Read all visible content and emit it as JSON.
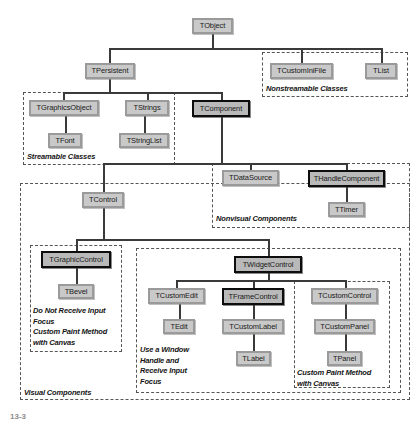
{
  "diagram": {
    "colors": {
      "node_fill": "#c9c9c9",
      "node_border": "#9a9a9a",
      "highlight_border": "#0d0d0d",
      "group_border": "#555555",
      "connector": "#3a3a3a",
      "background": "#ffffff"
    },
    "nodes": [
      {
        "id": "tobject",
        "label": "TObject",
        "x": 192,
        "y": 18,
        "w": 41,
        "h": 16,
        "style": "normal"
      },
      {
        "id": "tpersistent",
        "label": "TPersistent",
        "x": 85,
        "y": 63,
        "w": 50,
        "h": 16,
        "style": "normal"
      },
      {
        "id": "tcustominifile",
        "label": "TCustomIniFile",
        "x": 270,
        "y": 63,
        "w": 63,
        "h": 16,
        "style": "normal"
      },
      {
        "id": "tlist",
        "label": "TList",
        "x": 365,
        "y": 63,
        "w": 32,
        "h": 16,
        "style": "normal"
      },
      {
        "id": "tgraphicsobject",
        "label": "TGraphicsObject",
        "x": 29,
        "y": 100,
        "w": 70,
        "h": 16,
        "style": "normal"
      },
      {
        "id": "tstrings",
        "label": "TStrings",
        "x": 125,
        "y": 100,
        "w": 44,
        "h": 16,
        "style": "normal"
      },
      {
        "id": "tcomponent",
        "label": "TComponent",
        "x": 192,
        "y": 100,
        "w": 58,
        "h": 17,
        "style": "highlight"
      },
      {
        "id": "tfont",
        "label": "TFont",
        "x": 48,
        "y": 133,
        "w": 34,
        "h": 15,
        "style": "normal"
      },
      {
        "id": "tstringlist",
        "label": "TStringList",
        "x": 119,
        "y": 133,
        "w": 50,
        "h": 15,
        "style": "normal"
      },
      {
        "id": "tdatasource",
        "label": "TDataSource",
        "x": 222,
        "y": 170,
        "w": 57,
        "h": 16,
        "style": "normal"
      },
      {
        "id": "thandlecomponent",
        "label": "THandleComponent",
        "x": 308,
        "y": 170,
        "w": 77,
        "h": 17,
        "style": "highlight"
      },
      {
        "id": "ttimer",
        "label": "TTimer",
        "x": 328,
        "y": 202,
        "w": 37,
        "h": 15,
        "style": "normal"
      },
      {
        "id": "tcontrol",
        "label": "TControl",
        "x": 82,
        "y": 192,
        "w": 42,
        "h": 16,
        "style": "normal"
      },
      {
        "id": "tgraphiccontrol",
        "label": "TGraphicControl",
        "x": 41,
        "y": 251,
        "w": 70,
        "h": 17,
        "style": "highlight"
      },
      {
        "id": "tbevel",
        "label": "TBevel",
        "x": 58,
        "y": 284,
        "w": 36,
        "h": 15,
        "style": "normal"
      },
      {
        "id": "twidgetcontrol",
        "label": "TWidgetControl",
        "x": 234,
        "y": 256,
        "w": 68,
        "h": 17,
        "style": "highlight"
      },
      {
        "id": "tcustomedit",
        "label": "TCustomEdit",
        "x": 148,
        "y": 288,
        "w": 57,
        "h": 16,
        "style": "normal"
      },
      {
        "id": "tframecontrol",
        "label": "TFrameControl",
        "x": 222,
        "y": 288,
        "w": 62,
        "h": 17,
        "style": "highlight"
      },
      {
        "id": "tcustomcontrol",
        "label": "TCustomControl",
        "x": 311,
        "y": 288,
        "w": 67,
        "h": 16,
        "style": "normal"
      },
      {
        "id": "tedit",
        "label": "TEdit",
        "x": 163,
        "y": 319,
        "w": 32,
        "h": 15,
        "style": "normal"
      },
      {
        "id": "tcustomlabel",
        "label": "TCustomLabel",
        "x": 222,
        "y": 319,
        "w": 62,
        "h": 15,
        "style": "normal"
      },
      {
        "id": "tcustompanel",
        "label": "TCustomPanel",
        "x": 314,
        "y": 319,
        "w": 61,
        "h": 15,
        "style": "normal"
      },
      {
        "id": "tlabel",
        "label": "TLabel",
        "x": 236,
        "y": 351,
        "w": 35,
        "h": 15,
        "style": "normal"
      },
      {
        "id": "tpanel",
        "label": "TPanel",
        "x": 327,
        "y": 351,
        "w": 35,
        "h": 15,
        "style": "normal"
      }
    ],
    "groups": [
      {
        "id": "nonstreamable",
        "x": 262,
        "y": 52,
        "w": 146,
        "h": 45
      },
      {
        "id": "streamable",
        "x": 23,
        "y": 92,
        "w": 152,
        "h": 73
      },
      {
        "id": "nonvisual",
        "x": 212,
        "y": 163,
        "w": 198,
        "h": 65
      },
      {
        "id": "visual",
        "x": 20,
        "y": 183,
        "w": 390,
        "h": 217
      },
      {
        "id": "graphic",
        "x": 30,
        "y": 245,
        "w": 92,
        "h": 107
      },
      {
        "id": "widget",
        "x": 136,
        "y": 248,
        "w": 265,
        "h": 145
      },
      {
        "id": "customcontrol",
        "x": 294,
        "y": 281,
        "w": 96,
        "h": 107
      }
    ],
    "captions": [
      {
        "id": "cap-nonstreamable",
        "text": "Nonstreamable Classes",
        "x": 266,
        "y": 84
      },
      {
        "id": "cap-streamable",
        "text": "Streamable Classes",
        "x": 27,
        "y": 152
      },
      {
        "id": "cap-nonvisual",
        "text": "Nonvisual Components",
        "x": 216,
        "y": 214
      },
      {
        "id": "cap-graphic",
        "text": "Do Not Receive Input\nFocus\nCustom Paint Method\nwith Canvas",
        "x": 33,
        "y": 306
      },
      {
        "id": "cap-visual",
        "text": "Visual Components",
        "x": 24,
        "y": 388
      },
      {
        "id": "cap-widget",
        "text": "Use a Window\nHandle and\nReceive Input\nFocus",
        "x": 140,
        "y": 345
      },
      {
        "id": "cap-customcontrol",
        "text": "Custom Paint Method\nwith Canvas",
        "x": 297,
        "y": 368
      }
    ],
    "edges": [
      {
        "id": "e-tobject-stem",
        "type": "v",
        "x": 212,
        "y": 34,
        "len": 14
      },
      {
        "id": "e-tobject-bus",
        "type": "h",
        "x": 109,
        "y": 48,
        "len": 272
      },
      {
        "id": "e-tpersistent-drop",
        "type": "v",
        "x": 109,
        "y": 48,
        "len": 15
      },
      {
        "id": "e-tcustominifile-dr",
        "type": "v",
        "x": 301,
        "y": 48,
        "len": 15
      },
      {
        "id": "e-tlist-drop",
        "type": "v",
        "x": 381,
        "y": 48,
        "len": 15
      },
      {
        "id": "e-tpersistent-stem",
        "type": "v",
        "x": 109,
        "y": 79,
        "len": 13
      },
      {
        "id": "e-persist-bus",
        "type": "h",
        "x": 63,
        "y": 92,
        "len": 159
      },
      {
        "id": "e-tgraphicsobj-drop",
        "type": "v",
        "x": 63,
        "y": 92,
        "len": 8
      },
      {
        "id": "e-tstrings-drop",
        "type": "v",
        "x": 147,
        "y": 92,
        "len": 8
      },
      {
        "id": "e-tcomponent-drop",
        "type": "v",
        "x": 221,
        "y": 92,
        "len": 8
      },
      {
        "id": "e-tfont",
        "type": "v",
        "x": 65,
        "y": 116,
        "len": 17
      },
      {
        "id": "e-tstringlist",
        "type": "v",
        "x": 144,
        "y": 116,
        "len": 17
      },
      {
        "id": "e-tcomp-stem",
        "type": "v",
        "x": 221,
        "y": 117,
        "len": 46
      },
      {
        "id": "e-comp-bus",
        "type": "h",
        "x": 103,
        "y": 163,
        "len": 244
      },
      {
        "id": "e-tdatasource-drop",
        "type": "v",
        "x": 250,
        "y": 163,
        "len": 7
      },
      {
        "id": "e-thandle-drop",
        "type": "v",
        "x": 346,
        "y": 163,
        "len": 7
      },
      {
        "id": "e-comp-left-down",
        "type": "v",
        "x": 103,
        "y": 163,
        "len": 9
      },
      {
        "id": "e-comp-left-h",
        "type": "h",
        "x": 103,
        "y": 172,
        "len": 0
      },
      {
        "id": "e-tcontrol-drop",
        "type": "v",
        "x": 103,
        "y": 172,
        "len": 21
      },
      {
        "id": "e-ttimer",
        "type": "v",
        "x": 346,
        "y": 187,
        "len": 15
      },
      {
        "id": "e-tcontrol-stem",
        "type": "v",
        "x": 103,
        "y": 208,
        "len": 31
      },
      {
        "id": "e-control-bus",
        "type": "h",
        "x": 76,
        "y": 239,
        "len": 192
      },
      {
        "id": "e-tgraphic-drop",
        "type": "v",
        "x": 76,
        "y": 239,
        "len": 12
      },
      {
        "id": "e-twidget-drop",
        "type": "v",
        "x": 268,
        "y": 239,
        "len": 17
      },
      {
        "id": "e-tbevel",
        "type": "v",
        "x": 76,
        "y": 268,
        "len": 16
      },
      {
        "id": "e-twidget-stem",
        "type": "v",
        "x": 268,
        "y": 273,
        "len": 7
      },
      {
        "id": "e-widget-bus",
        "type": "h",
        "x": 176,
        "y": 280,
        "len": 169
      },
      {
        "id": "e-tcustomedit-drop",
        "type": "v",
        "x": 176,
        "y": 280,
        "len": 8
      },
      {
        "id": "e-tframectl-drop",
        "type": "v",
        "x": 253,
        "y": 280,
        "len": 8
      },
      {
        "id": "e-tcustomctl-drop",
        "type": "v",
        "x": 345,
        "y": 280,
        "len": 8
      },
      {
        "id": "e-tedit",
        "type": "v",
        "x": 179,
        "y": 304,
        "len": 15
      },
      {
        "id": "e-tcustomlabel",
        "type": "v",
        "x": 253,
        "y": 305,
        "len": 14
      },
      {
        "id": "e-tcustompanel",
        "type": "v",
        "x": 345,
        "y": 304,
        "len": 15
      },
      {
        "id": "e-tlabel",
        "type": "v",
        "x": 253,
        "y": 334,
        "len": 17
      },
      {
        "id": "e-tpanel",
        "type": "v",
        "x": 345,
        "y": 334,
        "len": 17
      }
    ],
    "footnote": "13-3"
  }
}
